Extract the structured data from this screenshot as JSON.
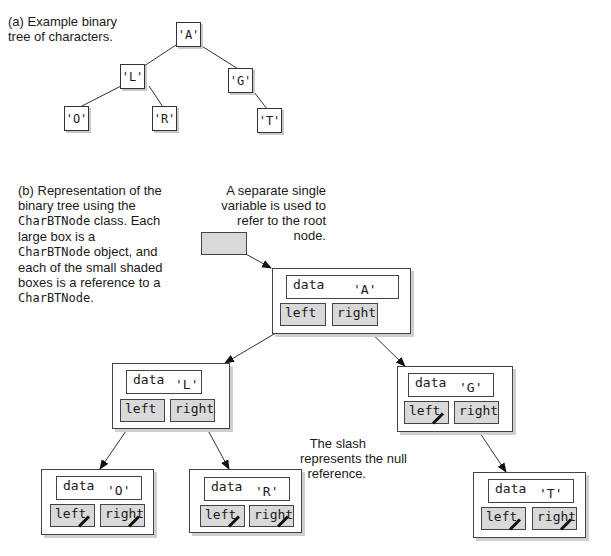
{
  "part_a": {
    "caption": [
      "(a) Example binary",
      "tree of characters."
    ],
    "nodes": {
      "A": "'A'",
      "L": "'L'",
      "G": "'G'",
      "O": "'O'",
      "R": "'R'",
      "T": "'T'"
    }
  },
  "part_b": {
    "caption": [
      {
        "text": "(b) Representation of the"
      },
      {
        "text": "binary tree using the"
      },
      {
        "code": "CharBTNode",
        "text": " class. Each"
      },
      {
        "text": "large box is a"
      },
      {
        "code": "CharBTNode",
        "text": " object, and"
      },
      {
        "text": "each of the small shaded"
      },
      {
        "text": "boxes is a reference to a"
      },
      {
        "code": "CharBTNode",
        "text": "."
      }
    ],
    "root_note": [
      "A separate single",
      "variable is used to",
      "refer to the root",
      "node."
    ],
    "slash_note": [
      "The slash",
      "represents the null",
      "reference."
    ],
    "field_labels": {
      "data": "data",
      "left": "left",
      "right": "right"
    },
    "nodes": [
      {
        "id": "A",
        "value": "'A'",
        "left_null": false,
        "right_null": false
      },
      {
        "id": "L",
        "value": "'L'",
        "left_null": false,
        "right_null": false
      },
      {
        "id": "G",
        "value": "'G'",
        "left_null": true,
        "right_null": false
      },
      {
        "id": "O",
        "value": "'O'",
        "left_null": true,
        "right_null": true
      },
      {
        "id": "R",
        "value": "'R'",
        "left_null": true,
        "right_null": true
      },
      {
        "id": "T",
        "value": "'T'",
        "left_null": true,
        "right_null": true
      }
    ]
  },
  "colors": {
    "reference_fill": "#d9d9d9",
    "border": "#444444",
    "shadow": "#cfcfcf"
  }
}
